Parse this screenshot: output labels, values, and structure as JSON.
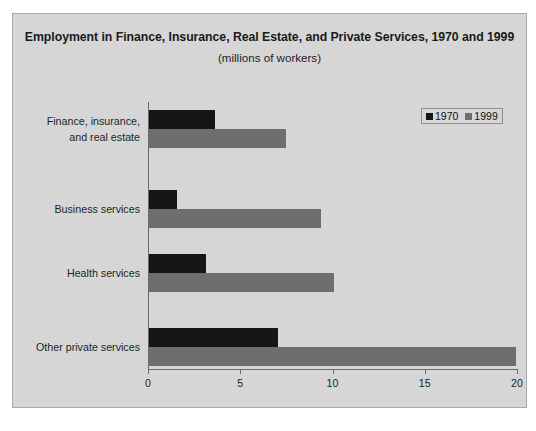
{
  "chart_data": {
    "type": "bar",
    "orientation": "horizontal",
    "title": "Employment in Finance, Insurance, Real Estate, and Private Services, 1970 and 1999",
    "subtitle": "(millions of workers)",
    "xlabel": "",
    "ylabel": "",
    "units": "millions of workers",
    "xlim": [
      0,
      20
    ],
    "xticks": [
      0,
      5,
      10,
      15,
      20
    ],
    "xtick_labels": [
      "0",
      "5",
      "10",
      "15",
      "20"
    ],
    "grid": false,
    "legend_position": "top-right",
    "categories": [
      "Finance, insurance, and real estate",
      "Business services",
      "Health services",
      "Other private services"
    ],
    "category_lines": [
      [
        "Finance, insurance,",
        "and real estate"
      ],
      [
        "Business services"
      ],
      [
        "Health services"
      ],
      [
        "Other private services"
      ]
    ],
    "series": [
      {
        "name": "1970",
        "color": "#161616",
        "values": [
          3.6,
          1.5,
          3.1,
          7.0
        ]
      },
      {
        "name": "1999",
        "color": "#6e6e6e",
        "values": [
          7.4,
          9.3,
          10.0,
          19.9
        ]
      }
    ]
  },
  "legend": {
    "entries": [
      {
        "label": "1970",
        "color": "#161616"
      },
      {
        "label": "1999",
        "color": "#6e6e6e"
      }
    ]
  },
  "colors": {
    "figure_background": "#d6d6d6",
    "page_background": "#ffffff",
    "frame_border": "#a9a9a9",
    "axis": "#6b6b6b",
    "series_1970": "#161616",
    "series_1999": "#6e6e6e",
    "text": "#1f1f1f"
  }
}
